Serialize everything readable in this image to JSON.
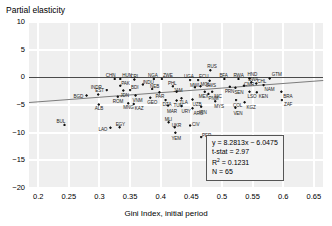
{
  "axes": {
    "ylabel_title": "Partial elasticity",
    "xlabel_title": "Gini Index, initial period",
    "yticks": [
      "10",
      "5",
      "0",
      "−5",
      "−10",
      "−15",
      "−20"
    ],
    "xticks": [
      "0.2",
      "0.25",
      "0.3",
      "0.35",
      "0.4",
      "0.45",
      "0.5",
      "0.55",
      "0.6",
      "0.65"
    ]
  },
  "stats": {
    "equation": "y = 8.2813x − 6.0475",
    "tstat": "t-stat = 2.97",
    "r2_label": "R",
    "r2_sup": "2",
    "r2_value": " = 0.1231",
    "n": "N = 65"
  },
  "colors": {
    "plot_background": "#efefef",
    "gridline": "#ffffff",
    "zero_line": "#4a4a4a",
    "trend_line": "#7c7c7c",
    "marker": "#111111"
  },
  "chart_data": {
    "type": "scatter",
    "title": "",
    "xlabel": "Gini Index, initial period",
    "ylabel": "Partial elasticity",
    "xlim": [
      0.185,
      0.665
    ],
    "ylim": [
      -20,
      10
    ],
    "grid": true,
    "legend": "none",
    "regression": {
      "equation": "y = 8.2813x - 6.0475",
      "slope": 8.2813,
      "intercept": -6.0475,
      "t_stat": 2.97,
      "r_squared": 0.1231,
      "n": 65
    },
    "reference_lines": [
      {
        "type": "horizontal",
        "y": 0
      }
    ],
    "points": [
      {
        "label": "BUL",
        "x": 0.243,
        "y": -8.6,
        "lx": -8,
        "ly": -6
      },
      {
        "label": "BGD",
        "x": 0.279,
        "y": -3.3,
        "lx": -13,
        "ly": -2
      },
      {
        "label": "EST",
        "x": 0.298,
        "y": -3.1,
        "lx": -3,
        "ly": -6
      },
      {
        "label": "ALB",
        "x": 0.299,
        "y": -4.9,
        "lx": -4,
        "ly": 2
      },
      {
        "label": "INDR",
        "x": 0.312,
        "y": -2.3,
        "lx": -16,
        "ly": -5
      },
      {
        "label": "LAO",
        "x": 0.318,
        "y": -9.1,
        "lx": -12,
        "ly": -1
      },
      {
        "label": "CHN",
        "x": 0.325,
        "y": -0.3,
        "lx": -9,
        "ly": -6
      },
      {
        "label": "HUN",
        "x": 0.334,
        "y": -0.3,
        "lx": 2,
        "ly": -6
      },
      {
        "label": "PAK",
        "x": 0.334,
        "y": -1.5,
        "lx": 1,
        "ly": -5
      },
      {
        "label": "ROM",
        "x": 0.33,
        "y": -3.5,
        "lx": -5,
        "ly": 2
      },
      {
        "label": "JDN",
        "x": 0.339,
        "y": -2.4,
        "lx": -3,
        "ly": 2
      },
      {
        "label": "EGY",
        "x": 0.333,
        "y": -9.0,
        "lx": -4,
        "ly": -5
      },
      {
        "label": "MNG",
        "x": 0.347,
        "y": -4.7,
        "lx": -5,
        "ly": 2
      },
      {
        "label": "KAZ",
        "x": 0.356,
        "y": -4.8,
        "lx": 1,
        "ly": 2
      },
      {
        "label": "BDI",
        "x": 0.35,
        "y": -2.3,
        "lx": 1,
        "ly": -5
      },
      {
        "label": "CRI",
        "x": 0.357,
        "y": -0.4,
        "lx": -4,
        "ly": -6
      },
      {
        "label": "VNM",
        "x": 0.359,
        "y": -3.3,
        "lx": -3,
        "ly": 2
      },
      {
        "label": "INDU",
        "x": 0.371,
        "y": -1.3,
        "lx": 0,
        "ly": -5
      },
      {
        "label": "NGA",
        "x": 0.389,
        "y": -0.3,
        "lx": -6,
        "ly": -6
      },
      {
        "label": "ZWE",
        "x": 0.402,
        "y": -0.3,
        "lx": 1,
        "ly": -6
      },
      {
        "label": "NEB",
        "x": 0.386,
        "y": -2.1,
        "lx": -2,
        "ly": -5
      },
      {
        "label": "GEO",
        "x": 0.383,
        "y": -3.7,
        "lx": -3,
        "ly": 2
      },
      {
        "label": "PAR",
        "x": 0.398,
        "y": -2.7,
        "lx": -4,
        "ly": 2
      },
      {
        "label": "MLI",
        "x": 0.413,
        "y": -8.1,
        "lx": -4,
        "ly": -5
      },
      {
        "label": "DZA",
        "x": 0.408,
        "y": -4.1,
        "lx": -3,
        "ly": 2
      },
      {
        "label": "MAR",
        "x": 0.412,
        "y": -5.1,
        "lx": -1,
        "ly": 3
      },
      {
        "label": "UKR",
        "x": 0.423,
        "y": -9.0,
        "lx": -3,
        "ly": -4
      },
      {
        "label": "YEM",
        "x": 0.424,
        "y": -10.0,
        "lx": -4,
        "ly": 3
      },
      {
        "label": "PHL",
        "x": 0.42,
        "y": -1.6,
        "lx": -5,
        "ly": -5
      },
      {
        "label": "JAM",
        "x": 0.426,
        "y": -2.6,
        "lx": -3,
        "ly": -4
      },
      {
        "label": "TUN",
        "x": 0.426,
        "y": -4.2,
        "lx": -3,
        "ly": 2
      },
      {
        "label": "TLA",
        "x": 0.434,
        "y": -3.8,
        "lx": -2,
        "ly": 2
      },
      {
        "label": "URY",
        "x": 0.434,
        "y": -5.2,
        "lx": 0,
        "ly": 3
      },
      {
        "label": "CIV",
        "x": 0.448,
        "y": -8.7,
        "lx": 2,
        "ly": -3
      },
      {
        "label": "UGA",
        "x": 0.448,
        "y": -0.5,
        "lx": -6,
        "ly": -6
      },
      {
        "label": "ECU",
        "x": 0.461,
        "y": -0.5,
        "lx": 1,
        "ly": -6
      },
      {
        "label": "UZB",
        "x": 0.452,
        "y": -4.0,
        "lx": 0,
        "ly": 3
      },
      {
        "label": "ARG",
        "x": 0.452,
        "y": -5.6,
        "lx": 1,
        "ly": 3
      },
      {
        "label": "MWI",
        "x": 0.456,
        "y": -1.8,
        "lx": -5,
        "ly": -4
      },
      {
        "label": "MOL",
        "x": 0.465,
        "y": -1.6,
        "lx": 0,
        "ly": -4
      },
      {
        "label": "RUS",
        "x": 0.481,
        "y": 1.3,
        "lx": -3,
        "ly": -6
      },
      {
        "label": "SWS",
        "x": 0.48,
        "y": -0.6,
        "lx": -4,
        "ly": 2
      },
      {
        "label": "MEX",
        "x": 0.472,
        "y": -2.6,
        "lx": -6,
        "ly": 2
      },
      {
        "label": "PNM",
        "x": 0.478,
        "y": -3.0,
        "lx": 0,
        "ly": 2
      },
      {
        "label": "NIC",
        "x": 0.484,
        "y": -2.6,
        "lx": 2,
        "ly": 2
      },
      {
        "label": "IRN",
        "x": 0.466,
        "y": -5.3,
        "lx": -2,
        "ly": 3
      },
      {
        "label": "MYS",
        "x": 0.489,
        "y": -4.3,
        "lx": -1,
        "ly": 3
      },
      {
        "label": "PER",
        "x": 0.466,
        "y": -10.8,
        "lx": 1,
        "ly": -4
      },
      {
        "label": "BFA",
        "x": 0.504,
        "y": -0.3,
        "lx": -5,
        "ly": -6
      },
      {
        "label": "RWA",
        "x": 0.527,
        "y": -0.3,
        "lx": -5,
        "ly": -6
      },
      {
        "label": "HND",
        "x": 0.545,
        "y": -0.2,
        "lx": -2,
        "ly": -6
      },
      {
        "label": "GTM",
        "x": 0.578,
        "y": -0.2,
        "lx": 2,
        "ly": -6
      },
      {
        "label": "BWA",
        "x": 0.548,
        "y": -0.9,
        "lx": -3,
        "ly": -5
      },
      {
        "label": "PRN",
        "x": 0.513,
        "y": -1.7,
        "lx": -5,
        "ly": 2
      },
      {
        "label": "SEN",
        "x": 0.522,
        "y": -1.9,
        "lx": -1,
        "ly": 2
      },
      {
        "label": "CMR",
        "x": 0.536,
        "y": -1.5,
        "lx": 0,
        "ly": -4
      },
      {
        "label": "LSO",
        "x": 0.545,
        "y": -2.6,
        "lx": -2,
        "ly": 2
      },
      {
        "label": "KEN",
        "x": 0.557,
        "y": -2.7,
        "lx": 2,
        "ly": 2
      },
      {
        "label": "COL",
        "x": 0.523,
        "y": -4.1,
        "lx": -3,
        "ly": 3
      },
      {
        "label": "KGZ",
        "x": 0.537,
        "y": -4.5,
        "lx": 2,
        "ly": 3
      },
      {
        "label": "VEN",
        "x": 0.522,
        "y": -5.5,
        "lx": -2,
        "ly": 3
      },
      {
        "label": "BRA",
        "x": 0.597,
        "y": -2.6,
        "lx": 2,
        "ly": 2
      },
      {
        "label": "ZAF",
        "x": 0.598,
        "y": -4.1,
        "lx": 2,
        "ly": 2
      },
      {
        "label": "CHL",
        "x": 0.556,
        "y": -1.1,
        "lx": 1,
        "ly": -4
      },
      {
        "label": "NAM",
        "x": 0.568,
        "y": -1.4,
        "lx": 1,
        "ly": 2
      }
    ]
  }
}
